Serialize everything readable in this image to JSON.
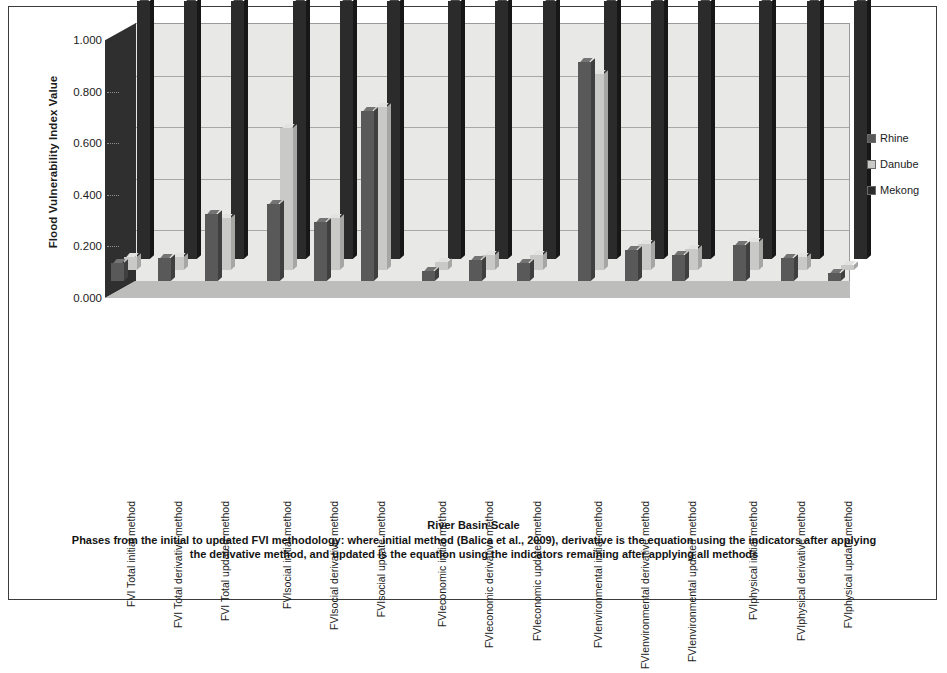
{
  "figure": {
    "y_axis_title": "Flood Vulnerability Index Value",
    "x_axis_title": "River Basin Scale",
    "caption": "Phases from the initial to updated FVI methodology: where initial method (Balica et al., 2009), derivative is the equation using the indicators after applying the derivative method, and updated is the equation using the indicators remaining after applying all methods"
  },
  "legend": {
    "position": "right",
    "items": [
      {
        "label": "Rhine",
        "color": "#595959"
      },
      {
        "label": "Danube",
        "color": "#c9c9c7"
      },
      {
        "label": "Mekong",
        "color": "#2b2b2b"
      }
    ]
  },
  "chart_data": {
    "type": "bar",
    "title": "",
    "xlabel": "River Basin Scale",
    "ylabel": "Flood Vulnerability Index Value",
    "ylim": [
      0,
      1
    ],
    "yticks": [
      "0.000",
      "0.200",
      "0.400",
      "0.600",
      "0.800",
      "1.000"
    ],
    "ytick_values": [
      0,
      0.2,
      0.4,
      0.6,
      0.8,
      1.0
    ],
    "grid": true,
    "projection": "3d-clustered-columns",
    "categories": [
      "FVI Total initial method",
      "FVI Total derivative method",
      "FVI Total updated method",
      "FVIsocial initial method",
      "FVIsocial derivative method",
      "FVIsocial update method",
      "FVIeconomic initial method",
      "FVIeconomic derivative method",
      "FVIeconomic updated method",
      "FVIenvironmental initial method",
      "FVIenvironmental derivative method",
      "FVIenvironmental updated method",
      "FVIphysical initial method",
      "FVIphysical derivative method",
      "FVIphysical update method"
    ],
    "series": [
      {
        "name": "Rhine",
        "color": "#595959",
        "values": [
          0.07,
          0.09,
          0.26,
          0.3,
          0.23,
          0.66,
          0.04,
          0.08,
          0.07,
          0.85,
          0.12,
          0.1,
          0.14,
          0.09,
          0.03
        ]
      },
      {
        "name": "Danube",
        "color": "#c9c9c7",
        "values": [
          0.05,
          0.05,
          0.2,
          0.55,
          0.2,
          0.63,
          0.03,
          0.06,
          0.06,
          0.76,
          0.1,
          0.08,
          0.11,
          0.05,
          0.02
        ]
      },
      {
        "name": "Mekong",
        "color": "#2b2b2b",
        "values": [
          1.0,
          1.0,
          1.0,
          1.0,
          1.0,
          1.0,
          1.0,
          1.0,
          1.0,
          1.0,
          1.0,
          1.0,
          1.0,
          1.0,
          1.0
        ]
      }
    ]
  }
}
